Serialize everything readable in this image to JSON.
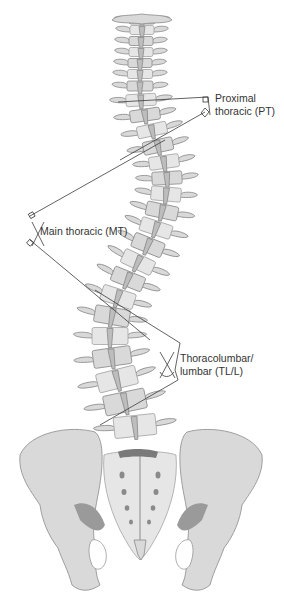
{
  "figure": {
    "curves": [
      {
        "id": "pt",
        "label_line1": "Proximal",
        "label_line2": "thoracic (PT)"
      },
      {
        "id": "mt",
        "label_line1": "Main thoracic (MT)"
      },
      {
        "id": "tl",
        "label_line1": "Thoracolumbar/",
        "label_line2": "lumbar (TL/L)"
      }
    ],
    "colors": {
      "bone": "#d9d9d9",
      "bone_outline": "#8a8a8a",
      "measurement_line": "#3a3a3a",
      "label_text": "#333333",
      "background": "#ffffff"
    }
  }
}
